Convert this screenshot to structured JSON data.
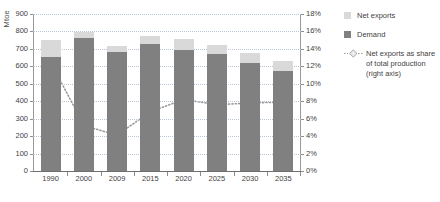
{
  "chart_data": {
    "type": "bar",
    "title": "",
    "xlabel": "",
    "ylabel": "Mtoe",
    "y2label": "",
    "categories": [
      "1990",
      "2000",
      "2009",
      "2015",
      "2020",
      "2025",
      "2030",
      "2035"
    ],
    "ylim": [
      0,
      900
    ],
    "ylim_right": [
      0,
      18
    ],
    "yticks": [
      "0",
      "100",
      "200",
      "300",
      "400",
      "500",
      "600",
      "700",
      "800",
      "900"
    ],
    "yticks_right": [
      "0%",
      "2%",
      "4%",
      "6%",
      "8%",
      "10%",
      "12%",
      "14%",
      "16%",
      "18%"
    ],
    "grid": true,
    "legend_position": "right",
    "stacked": true,
    "series": [
      {
        "name": "Demand",
        "type": "bar",
        "axis": "left",
        "color": "#808080",
        "values": [
          655,
          760,
          685,
          730,
          693,
          668,
          620,
          572
        ]
      },
      {
        "name": "Net exports",
        "type": "bar",
        "axis": "left",
        "color": "#d9d9d9",
        "values": [
          95,
          35,
          33,
          45,
          62,
          54,
          58,
          56
        ]
      },
      {
        "name": "Net exports as share of total production (right axis)",
        "type": "line",
        "axis": "right",
        "color": "#9a9a9a",
        "marker": "diamond",
        "linestyle": "dotted",
        "values": [
          12.5,
          5.2,
          4.1,
          6.8,
          8.2,
          7.6,
          7.8,
          7.9
        ]
      }
    ]
  },
  "legend": {
    "items": [
      {
        "label": "Net exports",
        "swatch": "light-gray-square"
      },
      {
        "label": "Demand",
        "swatch": "dark-gray-square"
      },
      {
        "label": "Net exports as share of total production (right axis)",
        "swatch": "dotted-diamond-marker"
      }
    ],
    "line_item_lines": [
      "Net exports as share",
      "of total production",
      "(right axis)"
    ]
  }
}
